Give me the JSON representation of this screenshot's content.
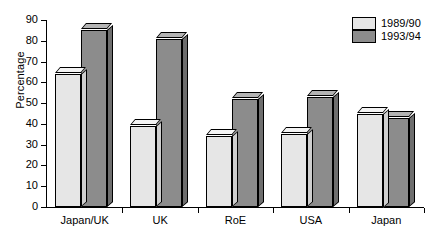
{
  "chart_data": {
    "type": "bar",
    "title": "",
    "subtitle": "",
    "xlabel": "",
    "ylabel": "Percentage",
    "ylim": [
      0,
      90
    ],
    "ytick_step": 10,
    "yticks": [
      90,
      80,
      70,
      60,
      50,
      40,
      30,
      20,
      10,
      0
    ],
    "grid": false,
    "legend_position": "top-right",
    "style": "3d-bars",
    "categories": [
      "Japan/UK",
      "UK",
      "RoE",
      "USA",
      "Japan"
    ],
    "series": [
      {
        "name": "1989/90",
        "color": "#e6e6e6",
        "values": [
          64,
          39,
          34,
          35,
          45
        ]
      },
      {
        "name": "1993/94",
        "color": "#8c8c8c",
        "values": [
          85,
          81,
          52,
          53,
          43
        ]
      }
    ]
  },
  "legend": {
    "entries": [
      {
        "label": "1989/90",
        "swatch": "light-gray-swatch"
      },
      {
        "label": "1993/94",
        "swatch": "dark-gray-swatch"
      }
    ]
  },
  "colors": {
    "series_1989_90": "#e6e6e6",
    "series_1993_94": "#8c8c8c",
    "axis": "#000000",
    "background": "#ffffff"
  }
}
